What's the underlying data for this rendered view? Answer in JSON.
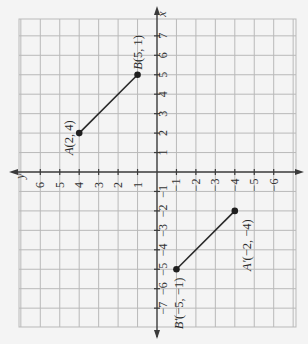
{
  "figure": {
    "rotation_deg": -90,
    "axes": {
      "x_axis_name": "x",
      "y_axis_name": "y",
      "x_ticks": [
        -7,
        -6,
        -5,
        -4,
        -3,
        -2,
        -1,
        1,
        2,
        3,
        4,
        5,
        6,
        7
      ],
      "y_ticks": [
        -6,
        -5,
        -4,
        -3,
        -2,
        -1,
        1,
        2,
        3,
        4,
        5,
        6
      ]
    },
    "colors": {
      "background": "#f4f4f4",
      "grid": "#b9b9b9",
      "axis": "#3a3a3a",
      "segment": "#2a2a2a"
    },
    "segments": [
      {
        "name": "AB",
        "points": [
          {
            "label": "A(2, 4)",
            "x": 2,
            "y": 4
          },
          {
            "label": "B(5, 1)",
            "x": 5,
            "y": 1
          }
        ]
      },
      {
        "name": "A'B'",
        "points": [
          {
            "label": "A′(−2, −4)",
            "x": -2,
            "y": -4
          },
          {
            "label": "B′(−5, −1)",
            "x": -5,
            "y": -1
          }
        ]
      }
    ]
  },
  "chart_data": {
    "type": "scatter",
    "title": "",
    "xlabel": "x",
    "ylabel": "y",
    "xlim": [
      -8,
      8
    ],
    "ylim": [
      -7,
      7
    ],
    "grid": true,
    "orientation": "rotated 90° CCW (x-axis vertical pointing up, y-axis horizontal pointing left)",
    "series": [
      {
        "name": "AB",
        "x": [
          2,
          5
        ],
        "y": [
          4,
          1
        ],
        "labels": [
          "A(2, 4)",
          "B(5, 1)"
        ]
      },
      {
        "name": "A'B'",
        "x": [
          -2,
          -5
        ],
        "y": [
          -4,
          -1
        ],
        "labels": [
          "A′(−2, −4)",
          "B′(−5, −1)"
        ]
      }
    ]
  }
}
